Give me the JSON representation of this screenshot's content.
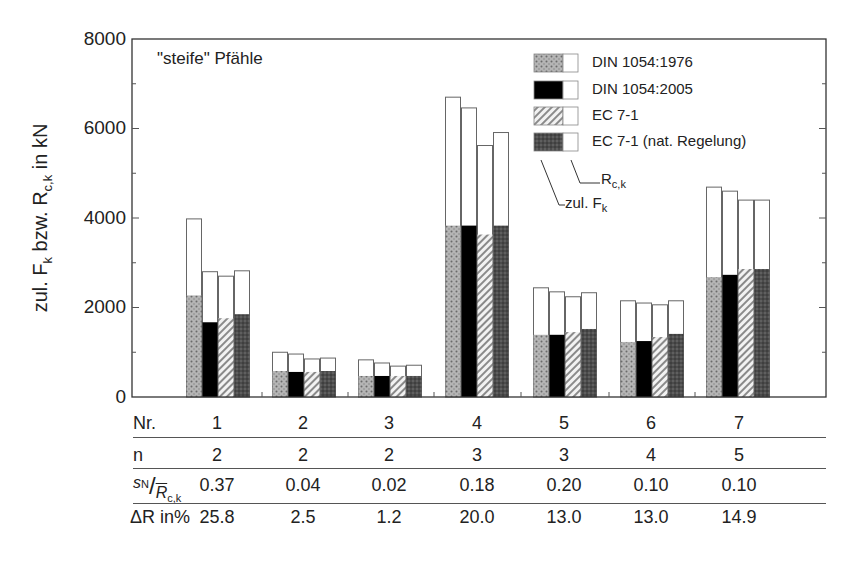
{
  "chart_data": {
    "type": "bar",
    "title": "",
    "subtitle": "\"steife\" Pfähle",
    "xlabel": "",
    "ylabel": "zul. F_k bzw. R_c,k in kN",
    "ylabel_parts": {
      "a": "zul. F",
      "a_sub": "k",
      "b": " bzw. R",
      "b_sub": "c,k",
      "c": " in kN"
    },
    "ylim": [
      0,
      8000
    ],
    "yticks": [
      0,
      2000,
      4000,
      6000,
      8000
    ],
    "grid": false,
    "legend_position": "upper right",
    "categories": [
      "1",
      "2",
      "3",
      "4",
      "5",
      "6",
      "7"
    ],
    "series": [
      {
        "name": "DIN 1054:1976",
        "pattern": "dotted-gray",
        "R_ck": [
          3980,
          1000,
          830,
          6700,
          2440,
          2150,
          4690
        ],
        "zul_F_k": [
          2270,
          580,
          470,
          3830,
          1390,
          1230,
          2680
        ]
      },
      {
        "name": "DIN 1054:2005",
        "pattern": "solid-black",
        "R_ck": [
          2800,
          960,
          760,
          6460,
          2350,
          2100,
          4600
        ],
        "zul_F_k": [
          1670,
          560,
          470,
          3830,
          1390,
          1250,
          2730
        ]
      },
      {
        "name": "EC 7-1",
        "pattern": "hatched-light",
        "R_ck": [
          2700,
          850,
          690,
          5620,
          2240,
          2060,
          4400
        ],
        "zul_F_k": [
          1760,
          560,
          470,
          3630,
          1450,
          1340,
          2860
        ]
      },
      {
        "name": "EC 7-1 (nat. Regelung)",
        "pattern": "dotted-dark",
        "R_ck": [
          2820,
          870,
          710,
          5910,
          2330,
          2150,
          4400
        ],
        "zul_F_k": [
          1850,
          580,
          470,
          3830,
          1520,
          1410,
          2860
        ]
      }
    ],
    "legend_annotations": {
      "rck_label": "R",
      "rck_sub": "c,k",
      "fk_label": "zul. F",
      "fk_sub": "k"
    },
    "table": {
      "rows": [
        {
          "label": "Nr.",
          "values": [
            "1",
            "2",
            "3",
            "4",
            "5",
            "6",
            "7"
          ]
        },
        {
          "label": "n",
          "values": [
            "2",
            "2",
            "2",
            "3",
            "3",
            "4",
            "5"
          ]
        },
        {
          "label": "sN/R̄c,k",
          "values": [
            "0.37",
            "0.04",
            "0.02",
            "0.18",
            "0.20",
            "0.10",
            "0.10"
          ]
        },
        {
          "label": "ΔR in%",
          "values": [
            "25.8",
            "2.5",
            "1.2",
            "20.0",
            "13.0",
            "13.0",
            "14.9"
          ]
        }
      ]
    }
  },
  "axis": {
    "y0": "0",
    "y2000": "2000",
    "y4000": "4000",
    "y6000": "6000",
    "y8000": "8000"
  },
  "colors": {
    "frame": "#333333",
    "black": "#000000",
    "dotted_gray": "#a8a8a8",
    "dotted_dark": "#555555",
    "hatched": "#d8d8d8"
  }
}
